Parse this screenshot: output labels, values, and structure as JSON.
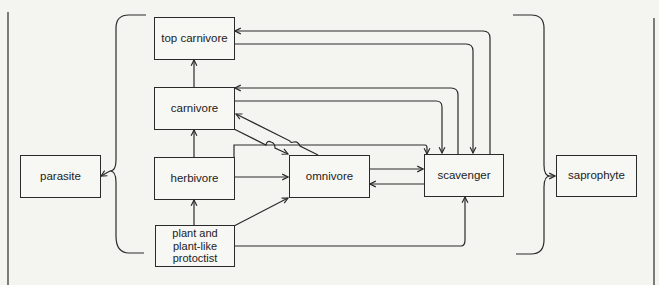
{
  "diagram": {
    "type": "food-web",
    "nodes": {
      "top_carnivore": "top carnivore",
      "carnivore": "carnivore",
      "herbivore": "herbivore",
      "producer": "plant and\nplant-like\nprotoctist",
      "producer_lines": [
        "plant and",
        "plant-like",
        "protoctist"
      ],
      "omnivore": "omnivore",
      "scavenger": "scavenger",
      "parasite": "parasite",
      "saprophyte": "saprophyte"
    },
    "edges": [
      {
        "from": "carnivore",
        "to": "top carnivore"
      },
      {
        "from": "herbivore",
        "to": "carnivore"
      },
      {
        "from": "plant and plant-like protoctist",
        "to": "herbivore"
      },
      {
        "from": "herbivore",
        "to": "omnivore"
      },
      {
        "from": "plant and plant-like protoctist",
        "to": "omnivore"
      },
      {
        "from": "omnivore",
        "to": "carnivore"
      },
      {
        "from": "carnivore",
        "to": "omnivore"
      },
      {
        "from": "omnivore",
        "to": "scavenger"
      },
      {
        "from": "scavenger",
        "to": "omnivore"
      },
      {
        "from": "herbivore",
        "to": "scavenger"
      },
      {
        "from": "plant and plant-like protoctist",
        "to": "scavenger"
      },
      {
        "from": "scavenger",
        "to": "top carnivore"
      },
      {
        "from": "top carnivore",
        "to": "scavenger"
      },
      {
        "from": "scavenger",
        "to": "carnivore"
      },
      {
        "from": "carnivore",
        "to": "scavenger"
      },
      {
        "from": "all organisms (bracket)",
        "to": "parasite"
      },
      {
        "from": "all organisms (bracket)",
        "to": "saprophyte"
      }
    ],
    "colors": {
      "line": "#2a2a2a",
      "background": "#f4f4f1"
    }
  }
}
